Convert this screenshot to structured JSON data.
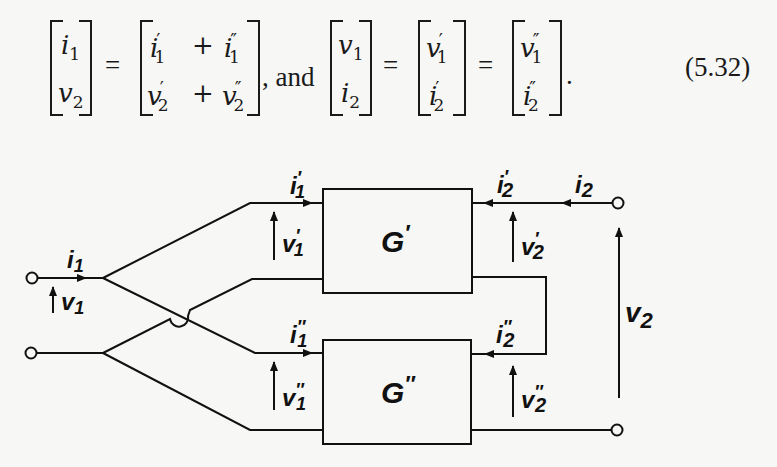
{
  "equation": {
    "number": "(5.32)",
    "connector": ", and",
    "equals": "=",
    "period": ".",
    "lhs1": {
      "top": {
        "base": "i",
        "sub": "1",
        "prime": ""
      },
      "bottom": {
        "base": "v",
        "sub": "2",
        "prime": ""
      }
    },
    "rhs1": {
      "top": [
        {
          "base": "i",
          "sub": "1",
          "prime": "′"
        },
        {
          "op": "+"
        },
        {
          "base": "i",
          "sub": "1",
          "prime": "″"
        }
      ],
      "bottom": [
        {
          "base": "v",
          "sub": "2",
          "prime": "′"
        },
        {
          "op": "+"
        },
        {
          "base": "v",
          "sub": "2",
          "prime": "″"
        }
      ]
    },
    "lhs2": {
      "top": {
        "base": "v",
        "sub": "1",
        "prime": ""
      },
      "bottom": {
        "base": "i",
        "sub": "2",
        "prime": ""
      }
    },
    "mid2": {
      "top": {
        "base": "v",
        "sub": "1",
        "prime": "′"
      },
      "bottom": {
        "base": "i",
        "sub": "2",
        "prime": "′"
      }
    },
    "rhs2": {
      "top": {
        "base": "v",
        "sub": "1",
        "prime": "″"
      },
      "bottom": {
        "base": "i",
        "sub": "2",
        "prime": "″"
      }
    }
  },
  "circuit": {
    "blocks": [
      {
        "id": "G1",
        "label": "G",
        "prime": "′"
      },
      {
        "id": "G2",
        "label": "G",
        "prime": "″"
      }
    ],
    "labels": {
      "i1": {
        "base": "i",
        "sub": "1",
        "prime": ""
      },
      "v1": {
        "base": "v",
        "sub": "1",
        "prime": ""
      },
      "i1p": {
        "base": "i",
        "sub": "1",
        "prime": "′"
      },
      "v1p": {
        "base": "v",
        "sub": "1",
        "prime": "′"
      },
      "i1pp": {
        "base": "i",
        "sub": "1",
        "prime": "″"
      },
      "v1pp": {
        "base": "v",
        "sub": "1",
        "prime": "″"
      },
      "i2": {
        "base": "i",
        "sub": "2",
        "prime": ""
      },
      "v2": {
        "base": "v",
        "sub": "2",
        "prime": ""
      },
      "i2p": {
        "base": "i",
        "sub": "2",
        "prime": "′"
      },
      "v2p": {
        "base": "v",
        "sub": "2",
        "prime": "′"
      },
      "i2pp": {
        "base": "i",
        "sub": "2",
        "prime": "″"
      },
      "v2pp": {
        "base": "v",
        "sub": "2",
        "prime": "″"
      }
    },
    "colors": {
      "ink": "#111111",
      "paper": "#f7f7f5"
    }
  }
}
